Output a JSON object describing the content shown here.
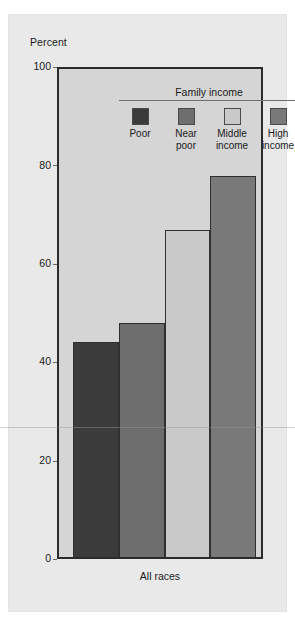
{
  "chart_data": {
    "type": "bar",
    "title": "",
    "subtitle": "",
    "xlabel": "All races",
    "ylabel": "Percent",
    "ylim": [
      0,
      100
    ],
    "yticks": [
      "0",
      "20",
      "40",
      "60",
      "80",
      "100"
    ],
    "grid": false,
    "legend_position": "inside-top-center",
    "legend_title": "Family income",
    "categories": [
      "All races"
    ],
    "series": [
      {
        "name": "Poor",
        "values": [
          44
        ],
        "color": "#3b3b3b"
      },
      {
        "name": "Near poor",
        "values": [
          48
        ],
        "color": "#6e6e6e"
      },
      {
        "name": "Middle income",
        "values": [
          67
        ],
        "color": "#c9c9c9"
      },
      {
        "name": "High income",
        "values": [
          78
        ],
        "color": "#797979"
      }
    ]
  },
  "axis": {
    "y_title": "Percent",
    "ticks": {
      "t0": "0",
      "t20": "20",
      "t40": "40",
      "t60": "60",
      "t80": "80",
      "t100": "100"
    },
    "x_group_label": "All races"
  },
  "legend": {
    "title": "Family income",
    "items": [
      {
        "label_line1": "Poor",
        "label_line2": "",
        "color": "#3b3b3b"
      },
      {
        "label_line1": "Near",
        "label_line2": "poor",
        "color": "#6e6e6e"
      },
      {
        "label_line1": "Middle",
        "label_line2": "income",
        "color": "#c9c9c9"
      },
      {
        "label_line1": "High",
        "label_line2": "income",
        "color": "#797979"
      }
    ]
  },
  "colors": {
    "page_background": "#ffffff",
    "panel_background": "#e9e9e9",
    "plot_background": "#d5d5d5",
    "frame": "#2b2b2b",
    "text": "#1a1a1a",
    "bar_poor": "#3b3b3b",
    "bar_near_poor": "#6e6e6e",
    "bar_middle_income": "#c9c9c9",
    "bar_high_income": "#797979"
  }
}
